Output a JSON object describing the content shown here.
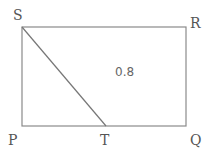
{
  "diagram": {
    "vertices": {
      "P": "P",
      "Q": "Q",
      "R": "R",
      "S": "S",
      "T": "T"
    },
    "region_value": "0.8",
    "shape": "rectangle PQRS with segment ST, T on PQ",
    "colors": {
      "line": "#8a8a8a",
      "text": "#555555"
    }
  }
}
